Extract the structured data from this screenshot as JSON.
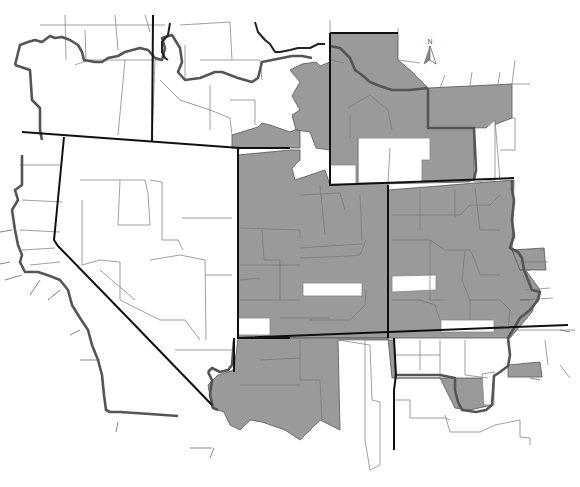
{
  "map": {
    "title": "",
    "north_label": "N",
    "colors": {
      "shaded_fill": "#9a9a9a",
      "unshaded_fill": "#ffffff",
      "state_border": "#111111",
      "region_border": "#555555",
      "county_border": "#777777"
    },
    "legend": {
      "shaded": "Shaded counties (gray)",
      "unshaded": "Unshaded counties (white)"
    }
  }
}
